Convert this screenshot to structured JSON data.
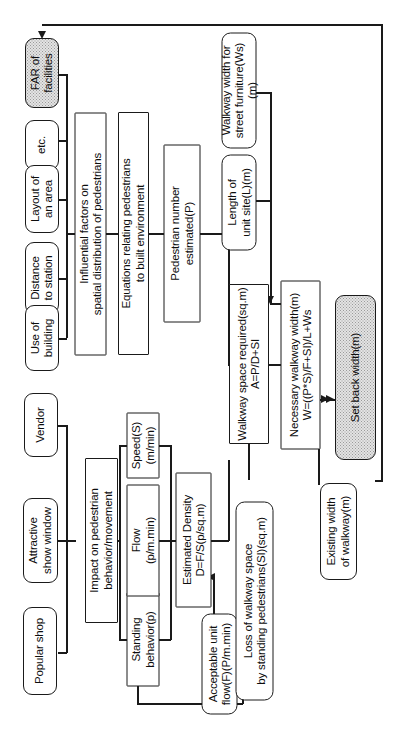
{
  "diagram": {
    "orientation": "rotated-90-ccw",
    "colors": {
      "line": "#1a1a1a",
      "node_fill": "#ffffff",
      "highlight_fill": "#e3e3e3",
      "text": "#0d0d0d"
    },
    "nodes": [
      {
        "id": "far_of_facilities",
        "label": "FAR of\nfacilities",
        "shape": "rounded",
        "fill": "stipple"
      },
      {
        "id": "etc",
        "label": "etc.",
        "shape": "rounded",
        "fill": "white"
      },
      {
        "id": "layout_of_an_area",
        "label": "Layout of\nan area",
        "shape": "rounded",
        "fill": "white"
      },
      {
        "id": "distance_to_station",
        "label": "Distance\nto station",
        "shape": "rounded",
        "fill": "white"
      },
      {
        "id": "use_of_building",
        "label": "Use of\nbuilding",
        "shape": "rounded",
        "fill": "white"
      },
      {
        "id": "influential_factors",
        "label": "Influential factors on\nspatial distribution of pedestrians",
        "shape": "rect",
        "fill": "white"
      },
      {
        "id": "equations_relating",
        "label": "Equations relating pedestrians\nto built environment",
        "shape": "rect",
        "fill": "white"
      },
      {
        "id": "pedestrian_number_estimated",
        "label": "Pedestrian number\nestimated(P)",
        "shape": "rect",
        "fill": "white"
      },
      {
        "id": "walkway_width_street_furniture",
        "label": "Walkway width for\nstreet furniture(Ws)(m)",
        "shape": "rounded",
        "fill": "white"
      },
      {
        "id": "length_of_unit_site",
        "label": "Length of\nunit site(L)(m)",
        "shape": "rounded",
        "fill": "white"
      },
      {
        "id": "walkway_space_required",
        "label": "Walkway space required(sq.m)\nA=P/D+SI",
        "shape": "rect",
        "fill": "white"
      },
      {
        "id": "necessary_walkway_width",
        "label": "Necessary walkway width(m)\nW=((P*S)/F+SI)/L+Ws",
        "shape": "rect",
        "fill": "white"
      },
      {
        "id": "set_back_width",
        "label": "Set back width(m)",
        "shape": "rounded",
        "fill": "stipple"
      },
      {
        "id": "existing_width_of_walkway",
        "label": "Existing width\nof walkway(m)",
        "shape": "rounded",
        "fill": "white"
      },
      {
        "id": "popular_shop",
        "label": "Popular shop",
        "shape": "rounded",
        "fill": "white"
      },
      {
        "id": "attractive_show_window",
        "label": "Attractive\nshow window",
        "shape": "rounded",
        "fill": "white"
      },
      {
        "id": "vendor",
        "label": "Vendor",
        "shape": "rounded",
        "fill": "white"
      },
      {
        "id": "impact_on_pedestrian",
        "label": "Impact on pedestrian\nbehavior/movement",
        "shape": "rect",
        "fill": "white"
      },
      {
        "id": "standing_behavior",
        "label": "Standing\nbehavior(p)",
        "shape": "rect",
        "fill": "white"
      },
      {
        "id": "flow",
        "label": "Flow\n(p/m.min)",
        "shape": "rect",
        "fill": "white"
      },
      {
        "id": "speed",
        "label": "Speed(S)\n(m/min)",
        "shape": "rect",
        "fill": "white"
      },
      {
        "id": "estimated_density",
        "label": "Estimated Density\nD=F/S(p/sq.m)",
        "shape": "rect",
        "fill": "white"
      },
      {
        "id": "acceptable_unit_flow",
        "label": "Acceptable unit\nflow(F)(P/m.min)",
        "shape": "rounded",
        "fill": "white"
      },
      {
        "id": "loss_of_walkway_space",
        "label": "Loss of walkway space\nby standing pedestrians(SI)(sq.m)",
        "shape": "rounded",
        "fill": "white"
      }
    ]
  }
}
